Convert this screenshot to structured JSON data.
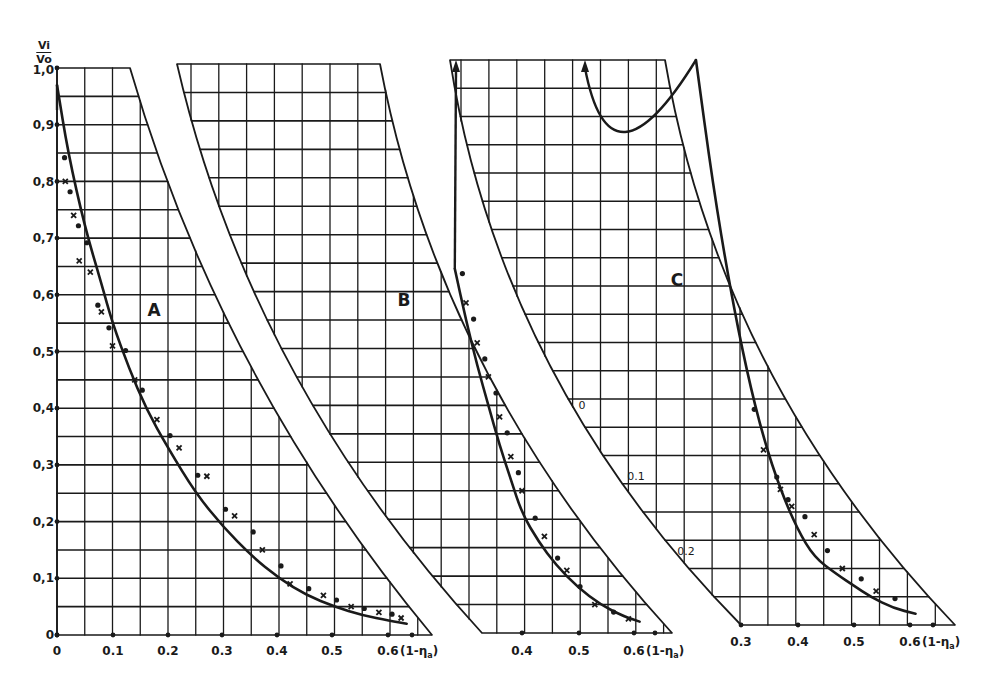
{
  "colors": {
    "ink": "#1a1a1a",
    "background": "#ffffff"
  },
  "y_axis_title": {
    "numerator": "Vi",
    "denominator": "Vo"
  },
  "x_axis_title": "(1-η",
  "x_axis_title_sub": "a",
  "x_axis_title_close": ")",
  "panels": [
    {
      "id": "A",
      "label": "A"
    },
    {
      "id": "B",
      "label": "B"
    },
    {
      "id": "C",
      "label": "C"
    }
  ],
  "y_ticks": [
    "0",
    "0,1",
    "0,2",
    "0,3",
    "0,4",
    "0,5",
    "0,6",
    "0,7",
    "0,8",
    "0,9",
    "1,0"
  ],
  "panel_a_x_ticks": [
    "0",
    "0.1",
    "0.2",
    "0.3",
    "0.4",
    "0.5",
    "0.6"
  ],
  "panel_b_x_ticks": [
    "0.4",
    "0.5",
    "0.6"
  ],
  "panel_c_x_ticks": [
    "0.3",
    "0.4",
    "0.5",
    "0.6"
  ],
  "panel_c_scale_labels": [
    "0",
    "0.1",
    "0.2"
  ],
  "chart_data": [
    {
      "type": "scatter",
      "title": "A",
      "xlabel": "(1-ηa)",
      "ylabel": "Vi/Vo",
      "xlim": [
        0,
        0.65
      ],
      "ylim": [
        0,
        1.0
      ],
      "grid": true,
      "x_ticks": [
        0,
        0.1,
        0.2,
        0.3,
        0.4,
        0.5,
        0.6
      ],
      "y_ticks": [
        0,
        0.1,
        0.2,
        0.3,
        0.4,
        0.5,
        0.6,
        0.7,
        0.8,
        0.9,
        1.0
      ],
      "series": [
        {
          "name": "fitted curve",
          "style": "line",
          "x": [
            0.0,
            0.02,
            0.05,
            0.08,
            0.1,
            0.13,
            0.16,
            0.2,
            0.25,
            0.3,
            0.35,
            0.4,
            0.45,
            0.5,
            0.55,
            0.6,
            0.63
          ],
          "y": [
            0.97,
            0.85,
            0.72,
            0.62,
            0.55,
            0.47,
            0.4,
            0.33,
            0.25,
            0.19,
            0.14,
            0.1,
            0.07,
            0.05,
            0.035,
            0.025,
            0.02
          ]
        },
        {
          "name": "measured points",
          "style": "markers",
          "x": [
            0.01,
            0.015,
            0.02,
            0.03,
            0.035,
            0.04,
            0.05,
            0.06,
            0.07,
            0.08,
            0.09,
            0.1,
            0.12,
            0.14,
            0.15,
            0.18,
            0.2,
            0.22,
            0.25,
            0.27,
            0.3,
            0.32,
            0.35,
            0.37,
            0.4,
            0.42,
            0.45,
            0.48,
            0.5,
            0.53,
            0.55,
            0.58,
            0.6,
            0.62
          ],
          "y": [
            0.84,
            0.8,
            0.78,
            0.74,
            0.72,
            0.66,
            0.69,
            0.64,
            0.58,
            0.57,
            0.54,
            0.51,
            0.5,
            0.45,
            0.43,
            0.38,
            0.35,
            0.33,
            0.28,
            0.28,
            0.22,
            0.21,
            0.18,
            0.15,
            0.12,
            0.09,
            0.08,
            0.07,
            0.06,
            0.05,
            0.045,
            0.04,
            0.035,
            0.03
          ]
        }
      ]
    },
    {
      "type": "scatter",
      "title": "B",
      "xlabel": "(1-ηa)",
      "ylabel": "Vi/Vo",
      "xlim": [
        0.33,
        0.67
      ],
      "x_ticks": [
        0.4,
        0.5,
        0.6
      ],
      "grid": true,
      "series": [
        {
          "name": "fitted curve",
          "style": "line",
          "x": [
            0.28,
            0.3,
            0.32,
            0.34,
            0.36,
            0.38,
            0.4,
            0.43,
            0.46,
            0.5,
            0.54,
            0.58,
            0.61
          ],
          "y": [
            0.64,
            0.55,
            0.47,
            0.4,
            0.33,
            0.27,
            0.21,
            0.16,
            0.12,
            0.08,
            0.05,
            0.03,
            0.02
          ]
        },
        {
          "name": "measured points",
          "style": "markers",
          "x": [
            0.29,
            0.3,
            0.31,
            0.32,
            0.33,
            0.34,
            0.35,
            0.36,
            0.37,
            0.38,
            0.39,
            0.4,
            0.42,
            0.44,
            0.46,
            0.48,
            0.5,
            0.53,
            0.56,
            0.59
          ],
          "y": [
            0.63,
            0.58,
            0.55,
            0.51,
            0.48,
            0.45,
            0.42,
            0.38,
            0.35,
            0.31,
            0.28,
            0.25,
            0.2,
            0.17,
            0.13,
            0.11,
            0.08,
            0.05,
            0.035,
            0.025
          ]
        }
      ]
    },
    {
      "type": "scatter",
      "title": "C",
      "xlabel": "(1-ηa)",
      "ylabel": "Vi/Vo",
      "xlim": [
        0.3,
        0.62
      ],
      "x_ticks": [
        0.3,
        0.4,
        0.5,
        0.6
      ],
      "grid": true,
      "annotations": [
        "0",
        "0.1",
        "0.2"
      ],
      "series": [
        {
          "name": "fitted curve",
          "style": "line",
          "x": [
            0.22,
            0.25,
            0.28,
            0.31,
            0.34,
            0.37,
            0.4,
            0.43,
            0.47,
            0.5,
            0.53,
            0.57,
            0.61
          ],
          "y": [
            1.0,
            0.78,
            0.6,
            0.45,
            0.33,
            0.24,
            0.17,
            0.12,
            0.09,
            0.07,
            0.05,
            0.03,
            0.02
          ]
        },
        {
          "name": "measured points",
          "style": "markers",
          "x": [
            0.32,
            0.34,
            0.36,
            0.37,
            0.38,
            0.39,
            0.41,
            0.43,
            0.45,
            0.48,
            0.51,
            0.54,
            0.57
          ],
          "y": [
            0.38,
            0.31,
            0.26,
            0.24,
            0.22,
            0.21,
            0.19,
            0.16,
            0.13,
            0.1,
            0.08,
            0.06,
            0.045
          ]
        }
      ]
    }
  ]
}
